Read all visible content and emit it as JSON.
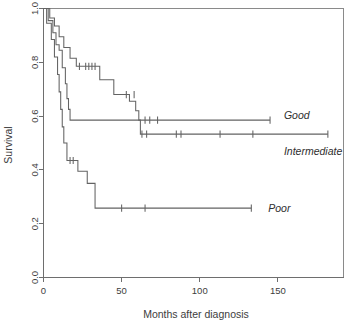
{
  "chart_data": {
    "type": "line",
    "subtype": "kaplan-meier-survival",
    "title": "",
    "xlabel": "Months after diagnosis",
    "ylabel": "Survival",
    "xlim": [
      0,
      192
    ],
    "ylim": [
      0.0,
      1.0
    ],
    "xticks": [
      0,
      50,
      100,
      150
    ],
    "xtick_labels": [
      "0",
      "50",
      "100",
      "150"
    ],
    "yticks": [
      0.0,
      0.2,
      0.4,
      0.6,
      0.8,
      1.0
    ],
    "ytick_labels": [
      "0.0",
      "0.2",
      "0.4",
      "0.6",
      "0.8",
      "1.0"
    ],
    "grid": false,
    "legend_position": "inline-right-of-curve-end",
    "line_color": "#636363",
    "series": [
      {
        "name": "Good",
        "label": "Good",
        "label_x": 150,
        "label_y": 0.605,
        "plateau": 0.585,
        "end_x": 145,
        "steps": [
          [
            0,
            1.0
          ],
          [
            4,
            1.0
          ],
          [
            4,
            0.965
          ],
          [
            7,
            0.965
          ],
          [
            7,
            0.935
          ],
          [
            10,
            0.935
          ],
          [
            10,
            0.895
          ],
          [
            13,
            0.895
          ],
          [
            13,
            0.855
          ],
          [
            17,
            0.855
          ],
          [
            17,
            0.815
          ],
          [
            21,
            0.815
          ],
          [
            21,
            0.785
          ],
          [
            36,
            0.785
          ],
          [
            36,
            0.735
          ],
          [
            45,
            0.735
          ],
          [
            45,
            0.68
          ],
          [
            55,
            0.68
          ],
          [
            55,
            0.655
          ],
          [
            59,
            0.655
          ],
          [
            59,
            0.62
          ],
          [
            61,
            0.62
          ],
          [
            61,
            0.585
          ],
          [
            145,
            0.585
          ]
        ],
        "censor_x": [
          23,
          27,
          29,
          31,
          33,
          53,
          58,
          65,
          68,
          73,
          145
        ],
        "censor_y": [
          0.785,
          0.785,
          0.785,
          0.785,
          0.785,
          0.68,
          0.68,
          0.585,
          0.585,
          0.585,
          0.585
        ]
      },
      {
        "name": "Intermediate",
        "label": "Intermediate",
        "label_x": 150,
        "label_y": 0.47,
        "plateau": 0.533,
        "end_x": 182,
        "steps": [
          [
            0,
            1.0
          ],
          [
            3,
            1.0
          ],
          [
            3,
            0.955
          ],
          [
            6,
            0.955
          ],
          [
            6,
            0.91
          ],
          [
            8,
            0.91
          ],
          [
            8,
            0.865
          ],
          [
            10,
            0.865
          ],
          [
            10,
            0.845
          ],
          [
            12,
            0.845
          ],
          [
            12,
            0.78
          ],
          [
            14,
            0.78
          ],
          [
            14,
            0.72
          ],
          [
            15,
            0.72
          ],
          [
            15,
            0.665
          ],
          [
            16,
            0.665
          ],
          [
            16,
            0.625
          ],
          [
            17,
            0.625
          ],
          [
            17,
            0.585
          ],
          [
            62,
            0.585
          ],
          [
            62,
            0.533
          ],
          [
            182,
            0.533
          ]
        ],
        "censor_x": [
          63,
          66,
          85,
          88,
          113,
          134,
          182
        ],
        "censor_y": [
          0.533,
          0.533,
          0.533,
          0.533,
          0.533,
          0.533,
          0.533
        ]
      },
      {
        "name": "Poor",
        "label": "Poor",
        "label_x": 140,
        "label_y": 0.258,
        "plateau": 0.258,
        "end_x": 133,
        "steps": [
          [
            0,
            1.0
          ],
          [
            2,
            1.0
          ],
          [
            2,
            0.945
          ],
          [
            5,
            0.945
          ],
          [
            5,
            0.885
          ],
          [
            7,
            0.885
          ],
          [
            7,
            0.82
          ],
          [
            9,
            0.82
          ],
          [
            9,
            0.755
          ],
          [
            10,
            0.755
          ],
          [
            10,
            0.69
          ],
          [
            11,
            0.69
          ],
          [
            11,
            0.625
          ],
          [
            12,
            0.625
          ],
          [
            12,
            0.56
          ],
          [
            13,
            0.56
          ],
          [
            13,
            0.5
          ],
          [
            15,
            0.5
          ],
          [
            15,
            0.435
          ],
          [
            22,
            0.435
          ],
          [
            22,
            0.395
          ],
          [
            28,
            0.395
          ],
          [
            28,
            0.35
          ],
          [
            33,
            0.35
          ],
          [
            33,
            0.258
          ],
          [
            133,
            0.258
          ]
        ],
        "censor_x": [
          17,
          19,
          50,
          65,
          133
        ],
        "censor_y": [
          0.435,
          0.435,
          0.258,
          0.258,
          0.258
        ]
      }
    ]
  },
  "axes": {
    "x_title": "Months after diagnosis",
    "y_title": "Survival"
  }
}
